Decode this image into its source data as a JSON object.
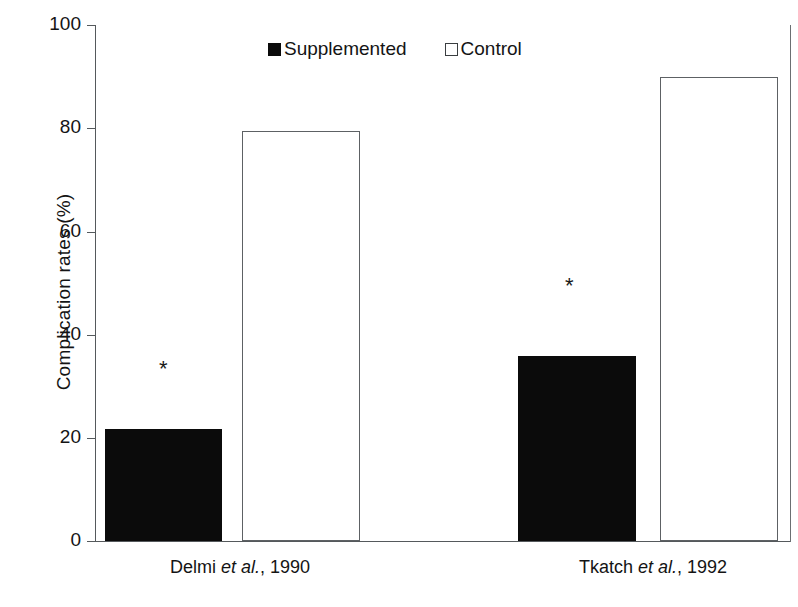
{
  "chart_data": {
    "type": "bar",
    "title": "",
    "xlabel": "",
    "ylabel": "Complication rates (%)",
    "ylim": [
      0,
      100
    ],
    "yticks": [
      0,
      20,
      40,
      60,
      80,
      100
    ],
    "categories": [
      "Delmi et al., 1990",
      "Tkatch et al., 1992"
    ],
    "grid": false,
    "legend_position": "top-center",
    "series": [
      {
        "name": "Supplemented",
        "values": [
          21.8,
          35.8
        ],
        "color": "#0b0b0b",
        "fill": "solid"
      },
      {
        "name": "Control",
        "values": [
          79.5,
          90.0
        ],
        "color": "#ffffff",
        "fill": "hollow"
      }
    ],
    "annotations": [
      {
        "text": "*",
        "category": "Delmi et al., 1990",
        "series": "Supplemented",
        "meaning": "significant difference"
      },
      {
        "text": "*",
        "category": "Tkatch et al., 1992",
        "series": "Supplemented",
        "meaning": "significant difference"
      }
    ]
  },
  "axis": {
    "y_title": "Complication rates (%)",
    "tick_labels": [
      "100",
      "80",
      "60",
      "40",
      "20",
      "0"
    ]
  },
  "legend": {
    "items": [
      {
        "label": "Supplemented",
        "swatch": "filled-square-icon"
      },
      {
        "label": "Control",
        "swatch": "hollow-square-icon"
      }
    ]
  },
  "categories": [
    {
      "name_part1": "Delmi ",
      "name_italic": "et al.",
      "name_part2": ", 1990",
      "full": "Delmi et al., 1990"
    },
    {
      "name_part1": "Tkatch ",
      "name_italic": "et al.",
      "name_part2": ", 1992",
      "full": "Tkatch et al., 1992"
    }
  ],
  "annotations": {
    "star": "*"
  }
}
